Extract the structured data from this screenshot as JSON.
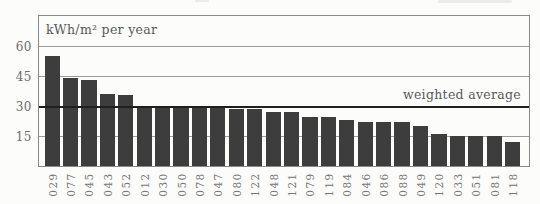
{
  "figure": {
    "background": "#fcfcfb"
  },
  "chart_data": {
    "type": "bar",
    "title": "",
    "ylabel": "kWh/m² per year",
    "xlabel": "",
    "categories": [
      "029",
      "077",
      "045",
      "043",
      "052",
      "012",
      "030",
      "050",
      "078",
      "047",
      "080",
      "122",
      "048",
      "121",
      "079",
      "119",
      "084",
      "046",
      "086",
      "088",
      "049",
      "120",
      "033",
      "051",
      "081",
      "118"
    ],
    "values": [
      55,
      44,
      43,
      36,
      35.5,
      30,
      30,
      30,
      30,
      30,
      28.5,
      28.5,
      27,
      27,
      24.5,
      24.5,
      23,
      22,
      22,
      22,
      20,
      16,
      15,
      15,
      15,
      12
    ],
    "yticks": [
      15,
      30,
      45,
      60
    ],
    "ylim": [
      0,
      75
    ],
    "grid": true,
    "legend": "none",
    "weighted_average": {
      "value": 29.3,
      "label": "weighted average"
    },
    "colors": {
      "bar": "#3d3d3d",
      "grid": "#9b9b9b",
      "border": "#8a8a8a",
      "average_line": "#1f1f1f",
      "label_text": "#595959",
      "tick_text": "#6b6b6b"
    }
  }
}
